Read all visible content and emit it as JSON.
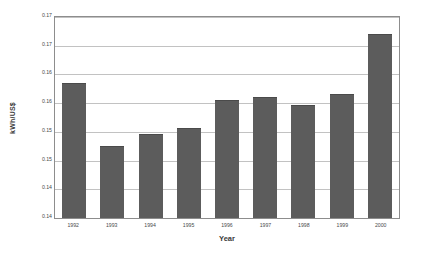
{
  "chart_data": {
    "type": "bar",
    "title": "",
    "xlabel": "Year",
    "ylabel": "kWh/US$",
    "categories": [
      "1992",
      "1993",
      "1994",
      "1995",
      "1996",
      "1997",
      "1998",
      "1999",
      "2000"
    ],
    "values": [
      0.1635,
      0.1525,
      0.1546,
      0.1556,
      0.1606,
      0.1611,
      0.1596,
      0.1616,
      0.1721
    ],
    "series": [
      {
        "name": "Energy intensity",
        "values": [
          0.1635,
          0.1525,
          0.1546,
          0.1556,
          0.1606,
          0.1611,
          0.1596,
          0.1616,
          0.1721
        ]
      }
    ],
    "ylim": [
      0.14,
      0.175
    ],
    "xlim_categories": 9,
    "ytick_values": [
      0.175,
      0.17,
      0.165,
      0.16,
      0.155,
      0.15,
      0.145,
      0.14
    ],
    "ytick_labels": [
      "0.17",
      "0.17",
      "0.16",
      "0.16",
      "0.15",
      "0.15",
      "0.14",
      "0.14"
    ],
    "grid": true,
    "grid_axis": "y",
    "legend": false,
    "legend_position": "none",
    "bar_color": "#5c5c5c",
    "gridline_color": "#c2c2c2",
    "axis_color": "#8d8d8d",
    "plot_background": "#ffffff",
    "figure_background": "#ffffff"
  }
}
